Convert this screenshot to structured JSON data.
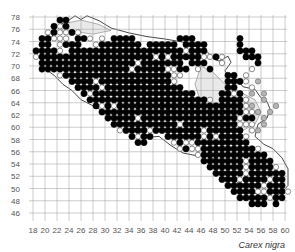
{
  "map": {
    "species_label": "Carex nigra",
    "x_ticks": [
      18,
      20,
      22,
      24,
      26,
      28,
      30,
      32,
      34,
      36,
      38,
      40,
      42,
      44,
      46,
      48,
      50,
      52,
      54,
      56,
      58,
      60
    ],
    "y_ticks": [
      78,
      76,
      74,
      72,
      70,
      68,
      66,
      64,
      62,
      60,
      58,
      56,
      54,
      52,
      50,
      48,
      46
    ],
    "colors": {
      "grid": "#9a9a9a",
      "outline": "#333333",
      "region_fill": "#e9e9e9",
      "present": "#000000",
      "open": "#ffffff",
      "gray": "#b5b5b5"
    },
    "legend_codes": {
      "B": "filled black circle",
      "W": "open white circle",
      "G": "gray circle"
    },
    "dot_grid": {
      "x_start": 18,
      "y_rows_top": 77,
      "rows": [
        "....BB.....................................",
        "...BWB.....................................",
        "..WBWWBW...................................",
        ".BBWWW.BBW.W.BBBB.......BBB.......B........",
        ".BB.WBBB..WBBBBBBB.BBBBB.BBBB.....B........",
        "BBBBW.BBBBBBBBBBBBBBBBBBBWBBB.....BBB......",
        "WBBBBBBBBBBBBBBBBBBBWBWBBBBBWWBW...BBB.....",
        ".BBBBBBBBBBBBBBBBWBBBBBBB.BBB..W.....B.....",
        ".BBBBBBBBBBBBBBBWBBBBBWWBB.W.B......W......",
        "....WBBBBBBBBBBBBBBBBBBWW.......BB.W.......",
        "......BBBBWBBBBBBBBBBBBW........BBBW.G.....",
        ".......BBBBWBBBBBBBBBBBBB.......BB..W......",
        "........BWBBBBBBBBBBBBBBBBB....BBWB.G.G....",
        ".........BBBBBBBBBBBBBBBBBBBBW.BBBBW..G....",
        "..........BWBWBBBBBBBBBBBBBBBBBBBBBWG...G..",
        "...........BBBBBBBBBBBBBBBBBBBBBBBBWWG.G...",
        "............BBBBBWBBBBBBBBBBBBBBBBWBB.G....",
        ".............BBBBBBBBBBBWBBBBBBBBBWWW.G....",
        "..............WBBBBWBBBBBBBBWBBBBBB.WG.....",
        "................BWBB..BBBBBBWBWBBBBW.......",
        ".................BB....WBWWBBBBBBBBB.......",
        "........................WBWWBBBBBBBBBW.....",
        "...........................WBBBBBBBBBBB....",
        "............................BBBBBBBWBBBB...",
        ".............................BBBBBBWBBBBW..",
        "..............................BBBBBWBBBBBB.",
        "...............................BBBWBBBBWBB.",
        "................................BBBBBBWBBB.",
        ".................................BBBBWWBBBW",
        "..................................BBBBBWBB.",
        "....................................BBB.B..",
        "...........................................",
        "..........................................."
      ]
    }
  }
}
